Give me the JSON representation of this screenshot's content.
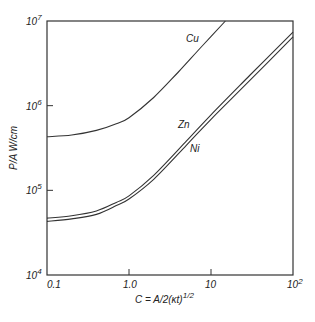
{
  "chart_data": {
    "type": "line",
    "title": "",
    "xlabel": "C = A/2(κt)^1/2",
    "ylabel": "P/A  W/cm",
    "xscale": "log",
    "yscale": "log",
    "xlim": [
      0.1,
      100
    ],
    "ylim": [
      10000,
      10000000
    ],
    "grid": false,
    "legend": "inline labels on curves",
    "x_ticks": [
      {
        "value": 0.1,
        "label": "0.1"
      },
      {
        "value": 1,
        "label": "1.0"
      },
      {
        "value": 10,
        "label": "10"
      },
      {
        "value": 100,
        "label": "10",
        "sup": "2"
      }
    ],
    "y_ticks": [
      {
        "value": 10000,
        "label": "10",
        "sup": "4"
      },
      {
        "value": 100000,
        "label": "10",
        "sup": "5"
      },
      {
        "value": 1000000,
        "label": "10",
        "sup": "6"
      },
      {
        "value": 10000000,
        "label": "10",
        "sup": "7"
      }
    ],
    "series": [
      {
        "name": "Cu",
        "x": [
          0.1,
          0.2,
          0.4,
          0.7,
          1.0,
          2.0,
          4.0,
          8.0,
          15.0
        ],
        "y": [
          430000,
          450000,
          510000,
          610000,
          720000,
          1250000,
          2500000,
          5200000,
          10000000
        ]
      },
      {
        "name": "Zn",
        "x": [
          0.1,
          0.2,
          0.4,
          0.7,
          1.0,
          2.0,
          5.0,
          10.0,
          30.0,
          100.0
        ],
        "y": [
          47000,
          50000,
          57000,
          72000,
          86000,
          150000,
          380000,
          780000,
          2300000,
          7400000
        ]
      },
      {
        "name": "Ni",
        "x": [
          0.1,
          0.2,
          0.4,
          0.7,
          1.0,
          2.0,
          5.0,
          10.0,
          30.0,
          100.0
        ],
        "y": [
          43000,
          46000,
          52000,
          66000,
          79000,
          135000,
          340000,
          690000,
          2000000,
          6500000
        ]
      }
    ],
    "annotations": [
      {
        "text": "Cu",
        "x_px": 186,
        "y_px": 42
      },
      {
        "text": "Zn",
        "x_px": 178,
        "y_px": 128
      },
      {
        "text": "Ni",
        "x_px": 190,
        "y_px": 152
      }
    ]
  }
}
